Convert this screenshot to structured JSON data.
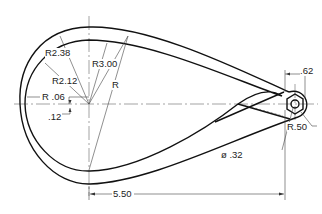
{
  "drawing": {
    "type": "technical-drawing",
    "description": "Teardrop-shaped link with curved arm and hexagonal hub",
    "dimensions": {
      "r_outer_small": "R2.38",
      "r_inner_small": "R2.12",
      "r_large": "R3.00",
      "r_unlabeled": "R",
      "r_fillet": "R .06",
      "offset": ".12",
      "hub_width": ".62",
      "hub_radius": "R.50",
      "hole_dia": "ø .32",
      "center_distance": "5.50"
    },
    "colors": {
      "line": "#111111",
      "thin": "#555555",
      "background": "#ffffff"
    }
  }
}
